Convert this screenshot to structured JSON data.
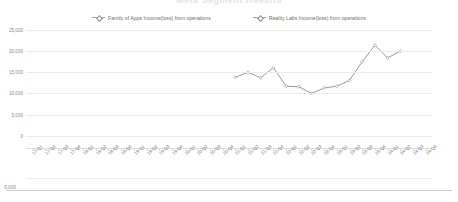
{
  "title": "Meta Segment Results",
  "legend": [
    {
      "label": "Family of Apps Income(loss) from operations",
      "marker": "line-diamond-marker",
      "color": "#9a9a9a"
    },
    {
      "label": "Reality Labs Income(loss) from operations",
      "marker": "line-diamond-marker",
      "color": "#9a9a9a"
    }
  ],
  "axis": {
    "y_ticks": [
      "25,000",
      "20,000",
      "15,000",
      "10,000",
      "5,000",
      "0",
      "-5,000",
      "-10,000"
    ],
    "x_label": "",
    "y_label": ""
  },
  "chart_data": {
    "type": "line",
    "title": "Meta Segment Results",
    "xlabel": "",
    "ylabel": "",
    "ylim": [
      -10000,
      25000
    ],
    "grid": true,
    "legend_position": "top-center",
    "categories": [
      "17-Q1",
      "17-Q2",
      "17-Q3",
      "17-Q4",
      "18-Q1",
      "18-Q2",
      "18-Q3",
      "18-Q4",
      "19-Q1",
      "19-Q2",
      "19-Q3",
      "19-Q4",
      "20-Q1",
      "20-Q2",
      "20-Q3",
      "20-Q4",
      "21-Q1",
      "21-Q2",
      "21-Q3",
      "21-Q4",
      "22-Q1",
      "22-Q2",
      "22-Q3",
      "22-Q4",
      "23-Q1",
      "23-Q2",
      "23-Q3",
      "23-Q4",
      "24-Q1",
      "24-Q2",
      "24-Q3",
      "24-Q4"
    ],
    "series": [
      {
        "name": "Family of Apps Income(loss) from operations",
        "color": "#8d8d8d",
        "values": [
          null,
          null,
          null,
          null,
          null,
          null,
          null,
          null,
          null,
          null,
          null,
          null,
          null,
          null,
          null,
          null,
          13800,
          15000,
          13700,
          16100,
          11700,
          11600,
          10000,
          11300,
          11700,
          13100,
          17500,
          21400,
          18400,
          20000,
          null,
          null
        ]
      },
      {
        "name": "Reality Labs Income(loss) from operations",
        "color": "#8d8d8d",
        "values": [
          null,
          null,
          null,
          null,
          null,
          null,
          null,
          null,
          null,
          null,
          null,
          null,
          null,
          null,
          null,
          null,
          null,
          null,
          null,
          null,
          null,
          null,
          null,
          null,
          null,
          null,
          null,
          null,
          null,
          null,
          null,
          null
        ]
      }
    ]
  }
}
